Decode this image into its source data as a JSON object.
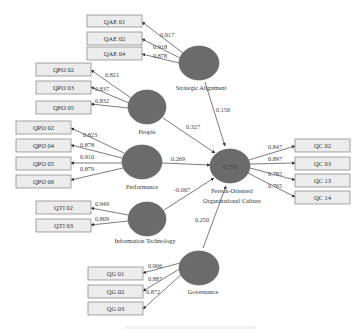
{
  "constructs": {
    "strategic_alignment": {
      "label": "Strategic Alignment"
    },
    "people": {
      "label": "People"
    },
    "performance": {
      "label": "Performance"
    },
    "information_technology": {
      "label": "Information Technology"
    },
    "governance": {
      "label": "Governance"
    },
    "culture": {
      "label_line1": "Person-Oriented",
      "label_line2": "Organizational Culture",
      "r_squared": "0.753"
    }
  },
  "indicators": {
    "strategic_alignment": [
      {
        "label": "QAE 01",
        "loading": "0.917"
      },
      {
        "label": "QAE 02",
        "loading": "0.918"
      },
      {
        "label": "QAE 04",
        "loading": "0.878"
      }
    ],
    "people": [
      {
        "label": "QPO 02",
        "loading": "0.821"
      },
      {
        "label": "QPO 03",
        "loading": "0.837"
      },
      {
        "label": "QPO 05",
        "loading": "0.832"
      }
    ],
    "performance": [
      {
        "label": "QPO 02",
        "loading": "0.823"
      },
      {
        "label": "QPO 04",
        "loading": "0.878"
      },
      {
        "label": "QPO 05",
        "loading": "0.910"
      },
      {
        "label": "QPO 06",
        "loading": "0.879"
      }
    ],
    "information_technology": [
      {
        "label": "QTI 02",
        "loading": "0.949"
      },
      {
        "label": "QTI 03",
        "loading": "0.809"
      }
    ],
    "governance": [
      {
        "label": "QG 01",
        "loading": "0.906"
      },
      {
        "label": "QG 02",
        "loading": "0.887"
      },
      {
        "label": "QG 03",
        "loading": "0.872"
      }
    ],
    "culture": [
      {
        "label": "QC 02",
        "loading": "0.847"
      },
      {
        "label": "QC 03",
        "loading": "0.897"
      },
      {
        "label": "QC 13",
        "loading": "0.785"
      },
      {
        "label": "QC 14",
        "loading": "0.765"
      }
    ]
  },
  "paths": {
    "strategic_alignment": "0.156",
    "people": "0.327",
    "performance": "0.269",
    "information_technology": "-0.067",
    "governance": "0.250"
  },
  "colors": {
    "construct_fill": "#6b6b6b",
    "indicator_fill": "#ececec",
    "indicator_border": "#8e8e8e",
    "edge": "#444444"
  }
}
